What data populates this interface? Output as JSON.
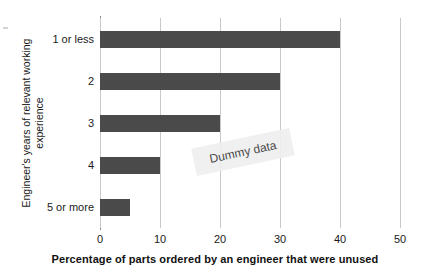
{
  "chart_data": {
    "type": "bar",
    "orientation": "horizontal",
    "title": "",
    "xlabel": "Percentage of parts ordered by an engineer that were unused",
    "ylabel_lines": [
      "Engineer's years of relevant working",
      "experience"
    ],
    "ylabel": "Engineer's years of relevant working experience",
    "categories": [
      "1 or less",
      "2",
      "3",
      "4",
      "5 or more"
    ],
    "values": [
      40,
      30,
      20,
      10,
      5
    ],
    "xlim": [
      0,
      50
    ],
    "xticks": [
      0,
      10,
      20,
      30,
      40,
      50
    ],
    "xtick_labels": [
      "0",
      "10",
      "20",
      "30",
      "40",
      "50"
    ],
    "grid": "vertical",
    "legend": "none",
    "annotations": [
      {
        "text": "Dummy data",
        "rotation": -12
      }
    ],
    "colors": {
      "bar": "#4a4a4a",
      "gridline": "#c8c8c8",
      "axis": "#8c8c8c",
      "watermark_bg": "#efefef",
      "watermark_text": "#3a3a3a",
      "background": "#ffffff"
    }
  },
  "watermark": {
    "label": "Dummy data"
  }
}
